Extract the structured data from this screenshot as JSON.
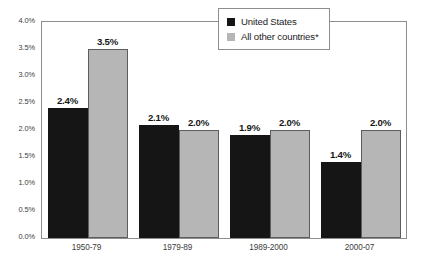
{
  "chart_data": {
    "type": "bar",
    "title": "",
    "subtitle": "",
    "xlabel": "",
    "ylabel": "",
    "categories": [
      "1950-79",
      "1979-89",
      "1989-2000",
      "2000-07"
    ],
    "series": [
      {
        "name": "United States",
        "color": "#151515",
        "values": [
          2.4,
          2.1,
          1.9,
          1.4
        ],
        "labels": [
          "2.4%",
          "2.1%",
          "1.9%",
          "1.4%"
        ]
      },
      {
        "name": "All other countries*",
        "color": "#b6b6b6",
        "values": [
          3.5,
          2.0,
          2.0,
          2.0
        ],
        "labels": [
          "3.5%",
          "2.0%",
          "2.0%",
          "2.0%"
        ]
      }
    ],
    "ylim": [
      0.0,
      4.0
    ],
    "ytick_values": [
      4.0,
      3.5,
      3.0,
      2.5,
      2.0,
      1.5,
      1.0,
      0.5,
      0.0
    ],
    "ytick_labels": [
      "4.0%",
      "3.5%",
      "3.0%",
      "2.5%",
      "2.0%",
      "1.5%",
      "1.0%",
      "0.5%",
      "0.0%"
    ],
    "grid": false,
    "legend_position": "top-right",
    "legend_entries": [
      "United States",
      "All other countries*"
    ]
  },
  "legend": {
    "items": [
      {
        "label": "United States"
      },
      {
        "label": "All other countries*"
      }
    ]
  }
}
